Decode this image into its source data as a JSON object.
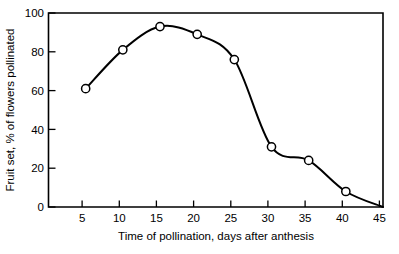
{
  "chart_data": {
    "type": "line",
    "title": "",
    "subtitle": "",
    "xlabel": "Time of pollination, days after anthesis",
    "ylabel": "Fruit set, % of flowers pollinated",
    "xlim": [
      0,
      45
    ],
    "ylim": [
      0,
      100
    ],
    "xticks": [
      5,
      10,
      15,
      20,
      25,
      30,
      35,
      40,
      45
    ],
    "xtick_labels": [
      "5",
      "10",
      "15",
      "20",
      "25",
      "30",
      "35",
      "40",
      "45"
    ],
    "yticks": [
      0,
      20,
      40,
      60,
      80,
      100
    ],
    "ytick_labels": [
      "0",
      "20",
      "40",
      "60",
      "80",
      "100"
    ],
    "grid": false,
    "legend": null,
    "marker": "open-circle",
    "line_color": "#000000",
    "marker_fill": "#ffffff",
    "marker_edge": "#000000",
    "series": [
      {
        "name": "Fruit set",
        "x": [
          5,
          10,
          15,
          20,
          25,
          30,
          35,
          40,
          45
        ],
        "values": [
          61,
          81,
          93,
          89,
          76,
          31,
          24,
          8,
          0
        ],
        "marker_shown": [
          true,
          true,
          true,
          true,
          true,
          true,
          true,
          true,
          false
        ]
      }
    ],
    "annotations": []
  },
  "figure": {
    "background": "#ffffff",
    "frame_color": "#000000"
  }
}
